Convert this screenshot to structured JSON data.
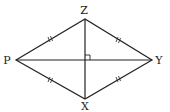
{
  "diagram": {
    "type": "rhombus",
    "vertices": [
      {
        "name": "Z",
        "label": "Z",
        "x": 85,
        "y": 19,
        "lx": 84,
        "ly": 14
      },
      {
        "name": "Y",
        "label": "Y",
        "x": 152,
        "y": 60,
        "lx": 159,
        "ly": 64
      },
      {
        "name": "X",
        "label": "X",
        "x": 85,
        "y": 99,
        "lx": 85,
        "ly": 110
      },
      {
        "name": "P",
        "label": "P",
        "x": 16,
        "y": 60,
        "lx": 7,
        "ly": 64
      }
    ],
    "sides": [
      "PZ",
      "ZY",
      "YX",
      "XP"
    ],
    "diagonals": [
      "ZX",
      "PY"
    ],
    "equal_side_marks": "double tick on each side",
    "right_angle_marker": "at intersection of diagonals",
    "stroke_color": "#222222"
  }
}
